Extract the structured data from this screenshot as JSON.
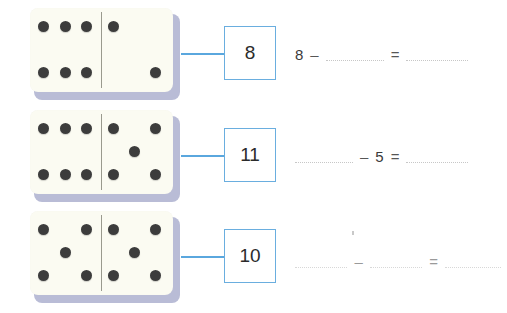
{
  "credit": {
    "text": "Ilustrações: Ilustra Cartoon/Arquivo da editora"
  },
  "colors": {
    "accent_blue": "#6aaedf",
    "connector_blue": "#5aa7de",
    "domino_face": "#fbfbf2",
    "domino_shadow": "#b9bcd6",
    "pip": "#3c3c3c",
    "divider": "#9a9a8e",
    "blank_dotted": "#c7c7c7"
  },
  "rows": [
    {
      "domino": {
        "left_count": 6,
        "right_count": 2,
        "left_pips": [
          "top-left",
          "top-middle",
          "top-right",
          "bottom-left",
          "bottom-middle",
          "bottom-right"
        ],
        "right_pips": [
          "top-left",
          "bottom-right"
        ]
      },
      "answer_box": {
        "value": "8"
      },
      "equation": {
        "terms": [
          "8",
          "–",
          "blank",
          "=",
          "blank"
        ],
        "first": "8",
        "operator": "–",
        "equals": "=",
        "blank1": "",
        "blank2": "",
        "faint": false
      }
    },
    {
      "domino": {
        "left_count": 6,
        "right_count": 5,
        "left_pips": [
          "top-left",
          "top-middle",
          "top-right",
          "bottom-left",
          "bottom-middle",
          "bottom-right"
        ],
        "right_pips": [
          "top-left",
          "top-right",
          "center",
          "bottom-left",
          "bottom-right"
        ]
      },
      "answer_box": {
        "value": "11"
      },
      "equation": {
        "terms": [
          "blank",
          "–",
          "5",
          "=",
          "blank"
        ],
        "first": "",
        "operator": "–",
        "middle": "5",
        "equals": "=",
        "blank1": "",
        "blank2": "",
        "faint": false
      }
    },
    {
      "domino": {
        "left_count": 5,
        "right_count": 5,
        "left_pips": [
          "top-left",
          "top-right",
          "center",
          "bottom-left",
          "bottom-right"
        ],
        "right_pips": [
          "top-left",
          "top-right",
          "center",
          "bottom-left",
          "bottom-right"
        ]
      },
      "answer_box": {
        "value": "10"
      },
      "equation": {
        "terms": [
          "blank",
          "–",
          "blank",
          "=",
          "blank"
        ],
        "operator": "–",
        "equals": "=",
        "blank1": "",
        "blank2": "",
        "blank3": "",
        "faint": true
      }
    }
  ]
}
